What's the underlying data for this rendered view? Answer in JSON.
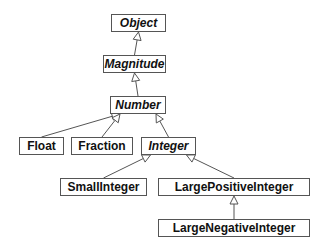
{
  "diagram": {
    "type": "class-hierarchy",
    "nodes": [
      {
        "id": "object",
        "label": "Object",
        "abstract": true,
        "x": 111,
        "y": 14,
        "w": 55
      },
      {
        "id": "magnitude",
        "label": "Magnitude",
        "abstract": true,
        "x": 103,
        "y": 55,
        "w": 63
      },
      {
        "id": "number",
        "label": "Number",
        "abstract": true,
        "x": 110,
        "y": 96,
        "w": 56
      },
      {
        "id": "float",
        "label": "Float",
        "abstract": false,
        "x": 19,
        "y": 137,
        "w": 45
      },
      {
        "id": "fraction",
        "label": "Fraction",
        "abstract": false,
        "x": 71,
        "y": 137,
        "w": 62
      },
      {
        "id": "integer",
        "label": "Integer",
        "abstract": true,
        "x": 141,
        "y": 137,
        "w": 55
      },
      {
        "id": "smallinteger",
        "label": "SmallInteger",
        "abstract": false,
        "x": 60,
        "y": 178,
        "w": 87
      },
      {
        "id": "largepositiveinteger",
        "label": "LargePositiveInteger",
        "abstract": false,
        "x": 158,
        "y": 178,
        "w": 152
      },
      {
        "id": "largenegativeinteger",
        "label": "LargeNegativeInteger",
        "abstract": false,
        "x": 158,
        "y": 219,
        "w": 152
      }
    ],
    "edges": [
      {
        "from": "magnitude",
        "to": "object"
      },
      {
        "from": "number",
        "to": "magnitude"
      },
      {
        "from": "float",
        "to": "number"
      },
      {
        "from": "fraction",
        "to": "number"
      },
      {
        "from": "integer",
        "to": "number"
      },
      {
        "from": "smallinteger",
        "to": "integer"
      },
      {
        "from": "largepositiveinteger",
        "to": "integer"
      },
      {
        "from": "largenegativeinteger",
        "to": "largepositiveinteger"
      }
    ]
  }
}
